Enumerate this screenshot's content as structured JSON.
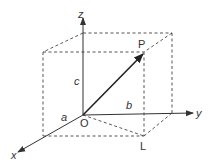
{
  "diagram": {
    "axes": {
      "x": "x",
      "y": "y",
      "z": "z"
    },
    "points": {
      "origin": "O",
      "tip": "P",
      "projection": "L"
    },
    "dimensions": {
      "a": "a",
      "b": "b",
      "c": "c"
    },
    "colors": {
      "line": "#333333",
      "background": "#ffffff"
    }
  }
}
